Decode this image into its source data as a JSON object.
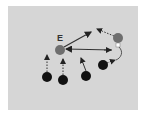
{
  "diagram": {
    "background_color": "#d6d6d6",
    "label_e": "E",
    "players": [
      {
        "id": "E",
        "x": 60,
        "y": 50,
        "color": "#6e6e6e"
      },
      {
        "id": "upper-right",
        "x": 118,
        "y": 38,
        "color": "#6e6e6e"
      },
      {
        "id": "b1",
        "x": 47,
        "y": 77,
        "color": "#111111"
      },
      {
        "id": "b2",
        "x": 63,
        "y": 80,
        "color": "#111111"
      },
      {
        "id": "b3",
        "x": 86,
        "y": 76,
        "color": "#111111"
      },
      {
        "id": "b4",
        "x": 103,
        "y": 65,
        "color": "#111111"
      }
    ]
  }
}
